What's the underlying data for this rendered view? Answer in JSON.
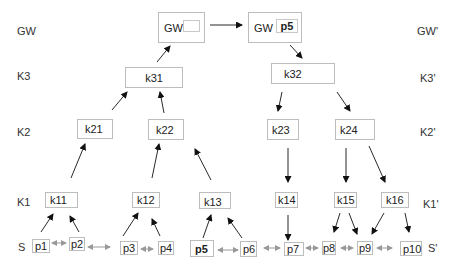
{
  "levels_left": [
    {
      "id": "gw",
      "label": "GW"
    },
    {
      "id": "k3",
      "label": "K3"
    },
    {
      "id": "k2",
      "label": "K2"
    },
    {
      "id": "k1",
      "label": "K1"
    },
    {
      "id": "s",
      "label": "S"
    }
  ],
  "levels_right": [
    {
      "id": "gw",
      "label": "GW'"
    },
    {
      "id": "k3",
      "label": "K3'"
    },
    {
      "id": "k2",
      "label": "K2'"
    },
    {
      "id": "k1",
      "label": "K1'"
    },
    {
      "id": "s",
      "label": "S'"
    }
  ],
  "gateway": {
    "left": {
      "label": "GW",
      "slot": ""
    },
    "right": {
      "label": "GW",
      "slot": "p5"
    }
  },
  "k3": [
    {
      "id": "k31",
      "label": "k31"
    },
    {
      "id": "k32",
      "label": "k32"
    }
  ],
  "k2": [
    {
      "id": "k21",
      "label": "k21"
    },
    {
      "id": "k22",
      "label": "k22"
    },
    {
      "id": "k23",
      "label": "k23"
    },
    {
      "id": "k24",
      "label": "k24"
    }
  ],
  "k1": [
    {
      "id": "k11",
      "label": "k11"
    },
    {
      "id": "k12",
      "label": "k12"
    },
    {
      "id": "k13",
      "label": "k13"
    },
    {
      "id": "k14",
      "label": "k14"
    },
    {
      "id": "k15",
      "label": "k15"
    },
    {
      "id": "k16",
      "label": "k16"
    }
  ],
  "peers": [
    {
      "id": "p1",
      "label": "p1",
      "bold": false
    },
    {
      "id": "p2",
      "label": "p2",
      "bold": false
    },
    {
      "id": "p3",
      "label": "p3",
      "bold": false
    },
    {
      "id": "p4",
      "label": "p4",
      "bold": false
    },
    {
      "id": "p5",
      "label": "p5",
      "bold": true
    },
    {
      "id": "p6",
      "label": "p6",
      "bold": false
    },
    {
      "id": "p7",
      "label": "p7",
      "bold": false
    },
    {
      "id": "p8",
      "label": "p8",
      "bold": false
    },
    {
      "id": "p9",
      "label": "p9",
      "bold": false
    },
    {
      "id": "p10",
      "label": "p10",
      "bold": false
    }
  ],
  "colors": {
    "edge": "#111111",
    "peer_link": "#9a9a9a",
    "node_border": "#bdbdbd"
  }
}
